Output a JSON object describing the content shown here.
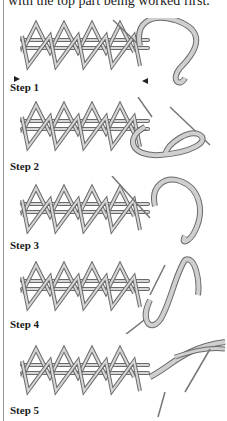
{
  "intro_text": "with the top part being worked first.",
  "steps": [
    {
      "label": "Step 1",
      "top": 18,
      "label_y": 62
    },
    {
      "label": "Step 2",
      "top": 97,
      "label_y": 62
    },
    {
      "label": "Step 3",
      "top": 176,
      "label_y": 62
    },
    {
      "label": "Step 4",
      "top": 255,
      "label_y": 62
    },
    {
      "label": "Step 5",
      "top": 337,
      "label_y": 62
    }
  ],
  "colors": {
    "thread": "#c9c9c9",
    "outline": "#6a6a6a",
    "rule": "#9a9a9a"
  }
}
